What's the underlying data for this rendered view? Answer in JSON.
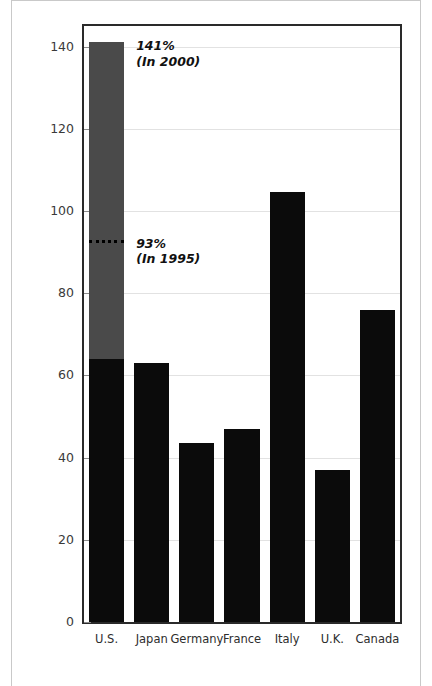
{
  "chart_data": {
    "type": "bar",
    "title": "",
    "xlabel": "",
    "ylabel": "Percent",
    "ylim": [
      0,
      145
    ],
    "yticks": [
      0,
      20,
      40,
      60,
      80,
      100,
      120,
      140
    ],
    "ytick_labels": [
      "0",
      "20",
      "40",
      "60",
      "80",
      "100",
      "120",
      "140"
    ],
    "grid": true,
    "legend": "none",
    "categories": [
      "U.S.",
      "Japan",
      "Germany",
      "France",
      "Italy",
      "U.K.",
      "Canada"
    ],
    "values": [
      141,
      63,
      43.5,
      47,
      104.5,
      37,
      76
    ],
    "series": [
      {
        "name": "In 1995 (base, black)",
        "values": [
          64,
          63,
          43.5,
          47,
          104.5,
          37,
          76
        ],
        "color": "#0b0b0b"
      },
      {
        "name": "Growth to 2000 (U.S. only, gray)",
        "values": [
          77,
          0,
          0,
          0,
          0,
          0,
          0
        ],
        "color": "#4a4a4a"
      }
    ],
    "annotations": [
      {
        "id": "us-2000",
        "line1": "141%",
        "line2": "(In 2000)",
        "value": 141,
        "category": "U.S."
      },
      {
        "id": "us-1995",
        "line1": "93%",
        "line2": "(In 1995)",
        "value": 93,
        "category": "U.S.",
        "marker": "dotted-line"
      }
    ]
  },
  "axis": {
    "y_title": "Percent"
  },
  "colors": {
    "bar_dark": "#0b0b0b",
    "bar_gray": "#4a4a4a",
    "grid": "#e2e2e2",
    "frame": "#2a2a2a",
    "page_rule": "#c9c9c9",
    "text": "#2d2d2d"
  }
}
